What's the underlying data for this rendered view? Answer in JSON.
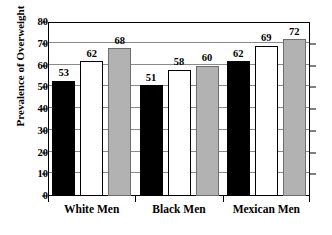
{
  "chart_data": {
    "type": "bar",
    "title": "",
    "xlabel": "",
    "ylabel": "Prevalence of Overweight",
    "ylim": [
      0,
      80
    ],
    "yticks": [
      0,
      10,
      20,
      30,
      40,
      50,
      60,
      70,
      80
    ],
    "ytick_labels": [
      "0",
      "10",
      "20",
      "30",
      "40",
      "50",
      "60",
      "70",
      "80"
    ],
    "grid": true,
    "legend": "none",
    "categories": [
      "White Men",
      "Black Men",
      "Mexican Men"
    ],
    "series": [
      {
        "name": "series-1",
        "color": "#000000",
        "style": "black",
        "values": [
          53,
          51,
          62
        ]
      },
      {
        "name": "series-2",
        "color": "#ffffff",
        "style": "white",
        "values": [
          62,
          58,
          69
        ]
      },
      {
        "name": "series-3",
        "color": "#b2b2b2",
        "style": "gray",
        "values": [
          68,
          60,
          72
        ]
      }
    ],
    "data_labels": [
      "53",
      "62",
      "68",
      "51",
      "58",
      "60",
      "62",
      "69",
      "72"
    ],
    "bar_order": [
      {
        "group": "White Men",
        "style": "black",
        "value": 53,
        "label": "53"
      },
      {
        "group": "White Men",
        "style": "white",
        "value": 62,
        "label": "62"
      },
      {
        "group": "White Men",
        "style": "gray",
        "value": 68,
        "label": "68"
      },
      {
        "group": "Black Men",
        "style": "black",
        "value": 51,
        "label": "51"
      },
      {
        "group": "Black Men",
        "style": "white",
        "value": 58,
        "label": "58"
      },
      {
        "group": "Black Men",
        "style": "gray",
        "value": 60,
        "label": "60"
      },
      {
        "group": "Mexican Men",
        "style": "black",
        "value": 62,
        "label": "62"
      },
      {
        "group": "Mexican Men",
        "style": "white",
        "value": 69,
        "label": "69"
      },
      {
        "group": "Mexican Men",
        "style": "gray",
        "value": 72,
        "label": "72"
      }
    ],
    "colors": {
      "black_bar": "#000000",
      "white_bar": "#ffffff",
      "gray_bar": "#b2b2b2",
      "axis": "#000000",
      "gridline": "#8a8a8a",
      "background": "#ffffff"
    }
  }
}
